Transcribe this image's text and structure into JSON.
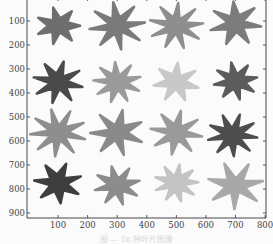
{
  "figure": {
    "caption": "图 — 16 种叶片图像",
    "x_ticks": [
      "100",
      "200",
      "300",
      "400",
      "500",
      "600",
      "700",
      "800"
    ],
    "y_ticks": [
      "100",
      "200",
      "300",
      "400",
      "500",
      "600",
      "700",
      "800",
      "900"
    ],
    "axis_color": "#333333",
    "background": "#fbfbfb"
  },
  "chart_data": {
    "type": "image-grid",
    "title": "",
    "xlabel": "",
    "ylabel": "",
    "xlim": [
      0,
      800
    ],
    "ylim": [
      0,
      930
    ],
    "y_inverted": true,
    "grid": false,
    "rows": 4,
    "cols": 4,
    "cells": [
      {
        "row": 1,
        "col": 1,
        "cx": 100,
        "cy": 120,
        "fill": "#6e6e6e"
      },
      {
        "row": 1,
        "col": 2,
        "cx": 300,
        "cy": 120,
        "fill": "#7a7a7a"
      },
      {
        "row": 1,
        "col": 3,
        "cx": 500,
        "cy": 120,
        "fill": "#8e8e8e"
      },
      {
        "row": 1,
        "col": 4,
        "cx": 700,
        "cy": 110,
        "fill": "#7c7c7c"
      },
      {
        "row": 2,
        "col": 1,
        "cx": 100,
        "cy": 355,
        "fill": "#4a4a4a"
      },
      {
        "row": 2,
        "col": 2,
        "cx": 300,
        "cy": 355,
        "fill": "#9a9a9a"
      },
      {
        "row": 2,
        "col": 3,
        "cx": 500,
        "cy": 355,
        "fill": "#c8c8c8"
      },
      {
        "row": 2,
        "col": 4,
        "cx": 700,
        "cy": 350,
        "fill": "#5c5c5c"
      },
      {
        "row": 3,
        "col": 1,
        "cx": 100,
        "cy": 565,
        "fill": "#8e8e8e"
      },
      {
        "row": 3,
        "col": 2,
        "cx": 300,
        "cy": 565,
        "fill": "#8a8a8a"
      },
      {
        "row": 3,
        "col": 3,
        "cx": 500,
        "cy": 565,
        "fill": "#9a9a9a"
      },
      {
        "row": 3,
        "col": 4,
        "cx": 690,
        "cy": 575,
        "fill": "#4e4e4e"
      },
      {
        "row": 4,
        "col": 1,
        "cx": 100,
        "cy": 775,
        "fill": "#3e3e3e"
      },
      {
        "row": 4,
        "col": 2,
        "cx": 300,
        "cy": 785,
        "fill": "#8c8c8c"
      },
      {
        "row": 4,
        "col": 3,
        "cx": 500,
        "cy": 775,
        "fill": "#c4c4c4"
      },
      {
        "row": 4,
        "col": 4,
        "cx": 700,
        "cy": 785,
        "fill": "#a8a8a8"
      }
    ]
  }
}
